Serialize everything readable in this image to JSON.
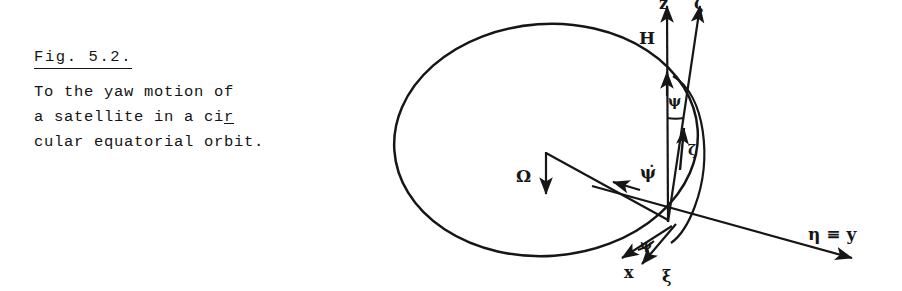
{
  "figure": {
    "caption_title": "Fig. 5.2.",
    "caption_lines": [
      {
        "text": "To the yaw motion of",
        "break_mark": ""
      },
      {
        "text": "a satellite in a ci",
        "break_mark": "r"
      },
      {
        "text": "cular equatorial orbit.",
        "break_mark": ""
      }
    ]
  },
  "diagram": {
    "labels": {
      "angular_momentum": "H",
      "orbital_rate": "Ω",
      "yaw_rate": "ψ̇",
      "yaw_angle_upper": "ψ",
      "yaw_angle_lower": "ψ",
      "body_axis_z": "ζ",
      "orbit_axis_y": "η ≡ y",
      "body_axis_x": "x",
      "orbit_axis_xi": "ξ",
      "vertical_axis_top_left": "z",
      "vertical_axis_top_right": "ζ"
    },
    "colors": {
      "ink": "#161616",
      "background": "#ffffff"
    }
  }
}
